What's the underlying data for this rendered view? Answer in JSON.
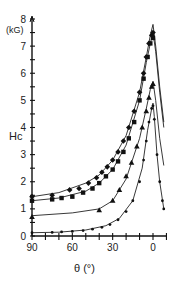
{
  "chart_data": {
    "type": "line",
    "title": "",
    "xlabel": "θ (°)",
    "ylabel": "Hc",
    "yunit": "(kG)",
    "xlim": [
      90,
      -10
    ],
    "ylim": [
      0,
      8
    ],
    "xticks": [
      90,
      80,
      70,
      60,
      50,
      40,
      30,
      20,
      10,
      0,
      -10
    ],
    "xtick_labels": [
      "90",
      "60",
      "30",
      "0"
    ],
    "yticks": [
      0,
      0.5,
      1,
      1.5,
      2,
      2.5,
      3,
      3.5,
      4,
      4.5,
      5,
      5.5,
      6,
      6.5,
      7,
      7.5,
      8
    ],
    "ytick_labels": [
      "0",
      "1",
      "2",
      "3",
      "4",
      "5",
      "6",
      "7",
      "8"
    ],
    "grid": false,
    "legend": null,
    "series": [
      {
        "name": "series-1 (diamonds)",
        "marker": "diamond",
        "points": [
          [
            90,
            1.45
          ],
          [
            75,
            1.5
          ],
          [
            62,
            1.7
          ],
          [
            55,
            1.75
          ],
          [
            48,
            1.95
          ],
          [
            42,
            2.15
          ],
          [
            38,
            2.35
          ],
          [
            34,
            2.55
          ],
          [
            30,
            2.8
          ],
          [
            26,
            3.1
          ],
          [
            22,
            3.5
          ],
          [
            18,
            4.0
          ],
          [
            14,
            4.6
          ],
          [
            10,
            5.3
          ],
          [
            7,
            6.0
          ],
          [
            5,
            6.6
          ],
          [
            3,
            7.1
          ],
          [
            1,
            7.4
          ],
          [
            0,
            7.5
          ]
        ],
        "curve": [
          [
            90,
            1.45
          ],
          [
            70,
            1.6
          ],
          [
            50,
            1.95
          ],
          [
            40,
            2.25
          ],
          [
            30,
            2.8
          ],
          [
            20,
            3.7
          ],
          [
            10,
            5.3
          ],
          [
            5,
            6.6
          ],
          [
            2,
            7.4
          ],
          [
            0,
            7.8
          ],
          [
            -2,
            7.0
          ],
          [
            -5,
            5.5
          ],
          [
            -8,
            4.2
          ]
        ]
      },
      {
        "name": "series-2 (squares)",
        "marker": "square",
        "points": [
          [
            90,
            1.3
          ],
          [
            75,
            1.35
          ],
          [
            68,
            1.4
          ],
          [
            60,
            1.45
          ],
          [
            52,
            1.6
          ],
          [
            45,
            1.75
          ],
          [
            40,
            1.95
          ],
          [
            35,
            2.2
          ],
          [
            30,
            2.45
          ],
          [
            26,
            2.75
          ],
          [
            22,
            3.1
          ],
          [
            18,
            3.6
          ],
          [
            14,
            4.2
          ],
          [
            10,
            5.0
          ],
          [
            7,
            5.8
          ],
          [
            4,
            6.6
          ],
          [
            2,
            7.1
          ],
          [
            0,
            7.3
          ]
        ],
        "curve": [
          [
            90,
            1.3
          ],
          [
            70,
            1.4
          ],
          [
            50,
            1.65
          ],
          [
            40,
            1.95
          ],
          [
            30,
            2.45
          ],
          [
            20,
            3.35
          ],
          [
            10,
            5.0
          ],
          [
            5,
            6.4
          ],
          [
            2,
            7.1
          ],
          [
            0,
            7.5
          ],
          [
            -2,
            6.8
          ],
          [
            -5,
            5.3
          ],
          [
            -8,
            4.0
          ]
        ]
      },
      {
        "name": "series-3 (triangles)",
        "marker": "triangle",
        "points": [
          [
            90,
            0.7
          ],
          [
            40,
            0.95
          ],
          [
            30,
            1.3
          ],
          [
            25,
            1.7
          ],
          [
            20,
            2.2
          ],
          [
            16,
            2.7
          ],
          [
            12,
            3.3
          ],
          [
            8,
            4.0
          ],
          [
            5,
            4.6
          ],
          [
            3,
            5.1
          ],
          [
            1,
            5.5
          ],
          [
            0,
            5.6
          ]
        ],
        "curve": [
          [
            90,
            0.75
          ],
          [
            60,
            0.85
          ],
          [
            40,
            1.0
          ],
          [
            30,
            1.3
          ],
          [
            20,
            2.1
          ],
          [
            10,
            3.6
          ],
          [
            5,
            4.7
          ],
          [
            2,
            5.4
          ],
          [
            0,
            5.7
          ],
          [
            -2,
            5.0
          ],
          [
            -5,
            3.6
          ],
          [
            -8,
            2.6
          ]
        ]
      },
      {
        "name": "series-4 (dots)",
        "marker": "dot",
        "points": [
          [
            90,
            0.12
          ],
          [
            75,
            0.13
          ],
          [
            68,
            0.15
          ],
          [
            60,
            0.17
          ],
          [
            52,
            0.2
          ],
          [
            45,
            0.25
          ],
          [
            38,
            0.32
          ],
          [
            32,
            0.42
          ],
          [
            26,
            0.6
          ],
          [
            20,
            0.9
          ],
          [
            15,
            1.3
          ],
          [
            10,
            2.0
          ],
          [
            7,
            2.8
          ],
          [
            5,
            3.5
          ],
          [
            3,
            4.2
          ],
          [
            1,
            4.7
          ],
          [
            0,
            4.8
          ],
          [
            -1,
            4.3
          ],
          [
            -3,
            3.0
          ],
          [
            -5,
            2.0
          ],
          [
            -7,
            1.3
          ],
          [
            -8,
            1.0
          ]
        ],
        "curve": [
          [
            90,
            0.12
          ],
          [
            70,
            0.14
          ],
          [
            50,
            0.22
          ],
          [
            35,
            0.38
          ],
          [
            25,
            0.65
          ],
          [
            15,
            1.3
          ],
          [
            8,
            2.5
          ],
          [
            4,
            3.9
          ],
          [
            1,
            4.7
          ],
          [
            0,
            4.9
          ],
          [
            -1,
            4.4
          ],
          [
            -3,
            3.0
          ],
          [
            -5,
            2.0
          ],
          [
            -8,
            1.0
          ]
        ]
      }
    ]
  }
}
